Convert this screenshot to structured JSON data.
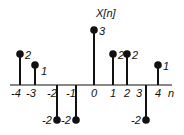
{
  "chart_data": {
    "type": "stem",
    "title": "X[n]",
    "xlabel": "n",
    "ylabel": "X[n]",
    "x": [
      -4,
      -3,
      -2,
      -1,
      0,
      1,
      2,
      3,
      4
    ],
    "values": [
      2,
      1,
      -2,
      -2,
      3,
      2,
      2,
      -2,
      1
    ],
    "tick_labels": [
      "-4",
      "-3",
      "-2",
      "-1",
      "0",
      "1",
      "2",
      "3",
      "4"
    ],
    "value_labels": [
      "2",
      "1",
      "-2",
      "-2",
      "3",
      "2",
      "2",
      "-2",
      "1"
    ],
    "grid": false,
    "legend": null
  },
  "plot": {
    "title_label": "X[n]",
    "axis_label": "n",
    "color": "#111111"
  }
}
